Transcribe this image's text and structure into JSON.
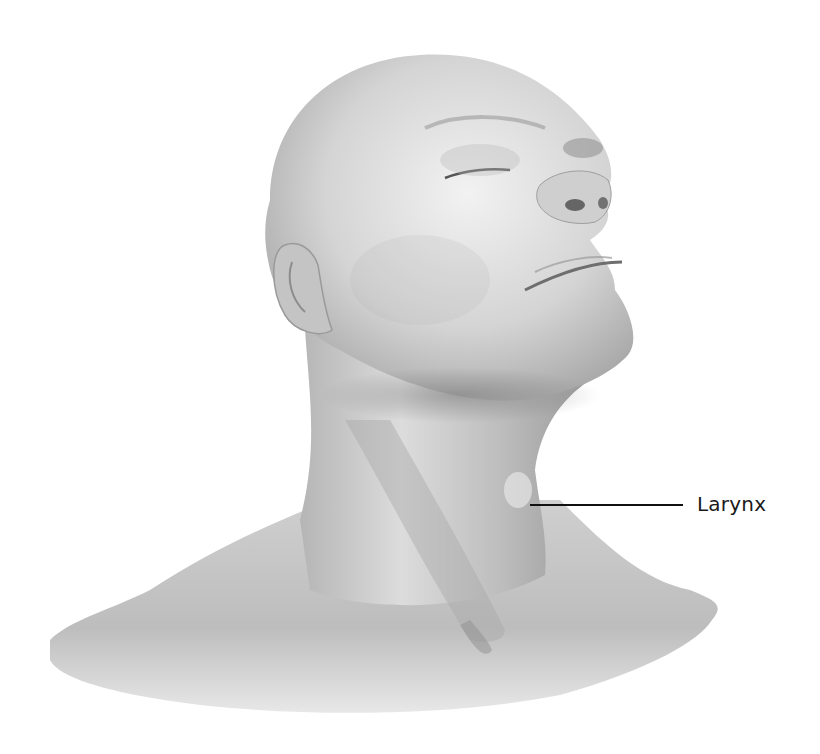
{
  "figure": {
    "labels": [
      {
        "text": "Larynx",
        "leader_from": [
          530,
          505
        ],
        "leader_to": [
          683,
          505
        ]
      }
    ]
  },
  "colors": {
    "background": "#ffffff",
    "skin_light": "#e6e6e6",
    "skin_mid": "#bdbdbd",
    "skin_dark": "#8c8c8c",
    "leader_line": "#111111",
    "label_text": "#1a1a1a"
  }
}
